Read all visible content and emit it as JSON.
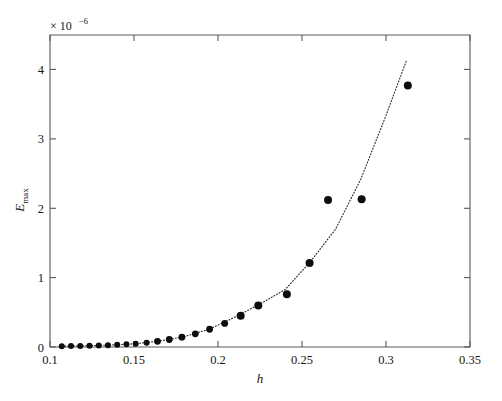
{
  "figure": {
    "background_color": "#ffffff",
    "axis_color": "#555a5e",
    "marker_color": "#0d0d0d",
    "curve_color": "#2b2b2b"
  },
  "annotations": {
    "y_multiplier_prefix": "× 10",
    "y_multiplier_exponent": "−6"
  },
  "chart_data": {
    "type": "scatter",
    "title": "",
    "xlabel": "h",
    "ylabel": "E_max",
    "ylabel_base": "E",
    "ylabel_sub": "max",
    "xlim": [
      0.1,
      0.35
    ],
    "ylim": [
      0,
      4.5
    ],
    "y_scale_factor": "1e-6",
    "grid": false,
    "legend": "none",
    "xticks": [
      0.1,
      0.15,
      0.2,
      0.25,
      0.3,
      0.35
    ],
    "xticklabels": [
      "0.1",
      "0.15",
      "0.2",
      "0.25",
      "0.3",
      "0.35"
    ],
    "yticks": [
      0,
      1,
      2,
      3,
      4
    ],
    "yticklabels": [
      "0",
      "1",
      "2",
      "3",
      "4"
    ],
    "series": [
      {
        "name": "E_max data",
        "marker": "filled-circle",
        "x": [
          0.107,
          0.1125,
          0.118,
          0.1235,
          0.129,
          0.1345,
          0.14,
          0.1455,
          0.151,
          0.1575,
          0.164,
          0.171,
          0.1785,
          0.1865,
          0.195,
          0.204,
          0.2135,
          0.224,
          0.241,
          0.2545,
          0.2655,
          0.2855,
          0.313
        ],
        "y": [
          0.012,
          0.014,
          0.016,
          0.019,
          0.022,
          0.026,
          0.031,
          0.038,
          0.047,
          0.062,
          0.082,
          0.108,
          0.142,
          0.19,
          0.256,
          0.34,
          0.452,
          0.6,
          0.76,
          1.21,
          2.12,
          2.13,
          3.77
        ]
      },
      {
        "name": "fitted trend (dotted)",
        "style": "dotted-line",
        "x": [
          0.107,
          0.12,
          0.135,
          0.15,
          0.165,
          0.18,
          0.195,
          0.21,
          0.225,
          0.24,
          0.255,
          0.27,
          0.285,
          0.3,
          0.312
        ],
        "y": [
          0.012,
          0.017,
          0.027,
          0.046,
          0.085,
          0.15,
          0.258,
          0.43,
          0.62,
          0.83,
          1.23,
          1.7,
          2.42,
          3.34,
          4.12
        ]
      }
    ]
  }
}
